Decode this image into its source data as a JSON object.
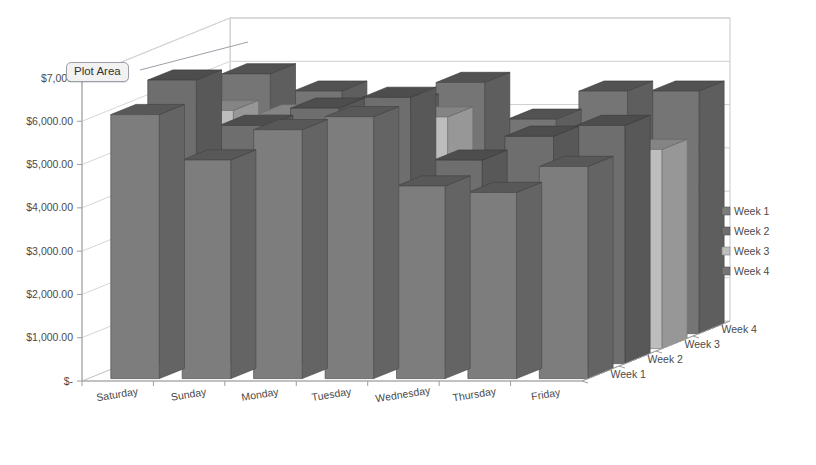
{
  "tooltip": {
    "label": "Plot Area"
  },
  "legend": {
    "position": "right",
    "items": [
      {
        "label": "Week 1",
        "color": "#7d7d7d"
      },
      {
        "label": "Week 2",
        "color": "#6e6e6e"
      },
      {
        "label": "Week 3",
        "color": "#bdbdbd"
      },
      {
        "label": "Week 4",
        "color": "#757575"
      }
    ]
  },
  "chart_data": {
    "type": "bar",
    "variant": "3d-clustered-column",
    "title": "",
    "xlabel": "",
    "ylabel": "",
    "zlabel": "",
    "grid": true,
    "ylim": [
      0,
      7000
    ],
    "ytick_labels": [
      "$-",
      "$1,000.00",
      "$2,000.00",
      "$3,000.00",
      "$4,000.00",
      "$5,000.00",
      "$6,000.00",
      "$7,000"
    ],
    "ytick_values": [
      0,
      1000,
      2000,
      3000,
      4000,
      5000,
      6000,
      7000
    ],
    "categories": [
      "Saturday",
      "Sunday",
      "Monday",
      "Tuesday",
      "Wednesday",
      "Thursday",
      "Friday"
    ],
    "depth_categories": [
      "Week 1",
      "Week 2",
      "Week 3",
      "Week 4"
    ],
    "series": [
      {
        "name": "Week 1",
        "color": "#7d7d7d",
        "values": [
          6100,
          5050,
          5750,
          6050,
          4450,
          4300,
          4900
        ]
      },
      {
        "name": "Week 2",
        "color": "#6e6e6e",
        "values": [
          6550,
          5500,
          5900,
          6150,
          4700,
          5250,
          5500
        ]
      },
      {
        "name": "Week 3",
        "color": "#bdbdbd",
        "values": [
          5500,
          5400,
          5200,
          5350,
          4150,
          4850,
          4600
        ]
      },
      {
        "name": "Week 4",
        "color": "#757575",
        "values": [
          6000,
          5600,
          5300,
          5800,
          4950,
          5600,
          5600
        ]
      }
    ]
  }
}
